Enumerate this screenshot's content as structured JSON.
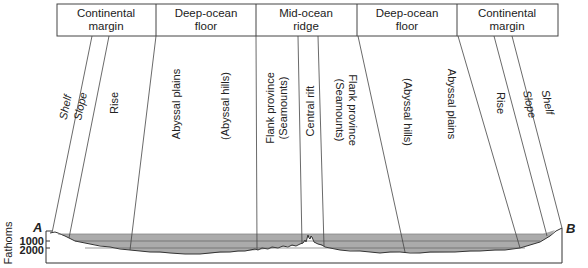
{
  "header": {
    "sections": [
      {
        "line1": "Continental",
        "line2": "margin"
      },
      {
        "line1": "Deep-ocean",
        "line2": "floor"
      },
      {
        "line1": "Mid-ocean",
        "line2": "ridge"
      },
      {
        "line1": "Deep-ocean",
        "line2": "floor"
      },
      {
        "line1": "Continental",
        "line2": "margin"
      }
    ]
  },
  "zones": {
    "left": {
      "shelf": "Shelf",
      "slope": "Slope",
      "rise": "Rise",
      "abyssal_plains": "Abyssal plains",
      "abyssal_hills": "(Abyssal hills)",
      "flank_line1": "Flank province",
      "flank_line2": "(Seamounts)"
    },
    "center": {
      "central_rift": "Central rift"
    },
    "right": {
      "flank_line1": "Flank province",
      "flank_line2": "(Seamounts)",
      "abyssal_hills": "(Abyssal hills)",
      "abyssal_plains": "Abyssal plains",
      "rise": "Rise",
      "slope": "Slope",
      "shelf": "Shelf"
    }
  },
  "profile": {
    "start_label": "A",
    "end_label": "B",
    "axis_label": "Fathoms",
    "ticks": [
      "1000",
      "2000"
    ]
  },
  "colors": {
    "water": "#a9a9a9",
    "line": "#333333",
    "background": "#ffffff"
  }
}
